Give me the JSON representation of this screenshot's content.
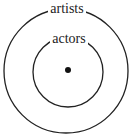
{
  "diagram": {
    "type": "euler",
    "sets": [
      {
        "label": "artists",
        "role": "outer"
      },
      {
        "label": "actors",
        "role": "inner"
      }
    ],
    "point": "dot at center of inner set",
    "colors": {
      "stroke": "#222222",
      "background": "#ffffff"
    }
  }
}
